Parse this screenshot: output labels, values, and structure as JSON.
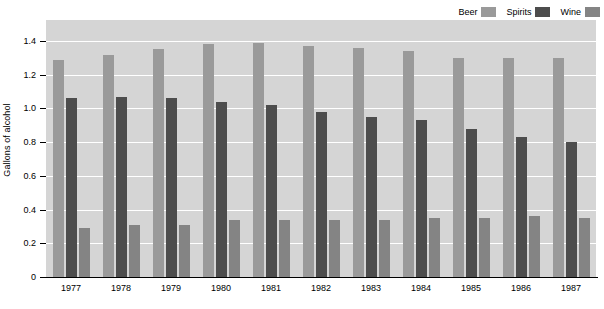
{
  "chart_data": {
    "type": "bar",
    "title": "",
    "subtitle": "",
    "xlabel": "",
    "ylabel": "Gallons of alcohol",
    "ylim": [
      0,
      1.4
    ],
    "yticks": [
      "0",
      "0.2",
      "0.4",
      "0.6",
      "0.8",
      "1.0",
      "1.2",
      "1.4"
    ],
    "ytick_values": [
      0,
      0.2,
      0.4,
      0.6,
      0.8,
      1.0,
      1.2,
      1.4
    ],
    "grid": true,
    "grid_color": "#ffffff",
    "plot_background": "#d5d5d5",
    "legend_position": "top-right",
    "categories": [
      "1977",
      "1978",
      "1979",
      "1980",
      "1981",
      "1982",
      "1983",
      "1984",
      "1985",
      "1986",
      "1987"
    ],
    "series": [
      {
        "name": "Beer",
        "color": "#9a9a9a",
        "values": [
          1.29,
          1.32,
          1.35,
          1.38,
          1.39,
          1.37,
          1.36,
          1.34,
          1.3,
          1.3,
          1.3
        ]
      },
      {
        "name": "Spirits",
        "color": "#4d4d4d",
        "values": [
          1.06,
          1.07,
          1.06,
          1.04,
          1.02,
          0.98,
          0.95,
          0.93,
          0.88,
          0.83,
          0.8
        ]
      },
      {
        "name": "Wine",
        "color": "#848484",
        "values": [
          0.29,
          0.31,
          0.31,
          0.34,
          0.34,
          0.34,
          0.34,
          0.35,
          0.35,
          0.36,
          0.35
        ]
      }
    ]
  },
  "legend": {
    "entries": [
      {
        "label": "Beer",
        "color": "#9a9a9a"
      },
      {
        "label": "Spirits",
        "color": "#4d4d4d"
      },
      {
        "label": "Wine",
        "color": "#848484"
      }
    ]
  },
  "axes": {
    "y_title": "Gallons of alcohol"
  }
}
